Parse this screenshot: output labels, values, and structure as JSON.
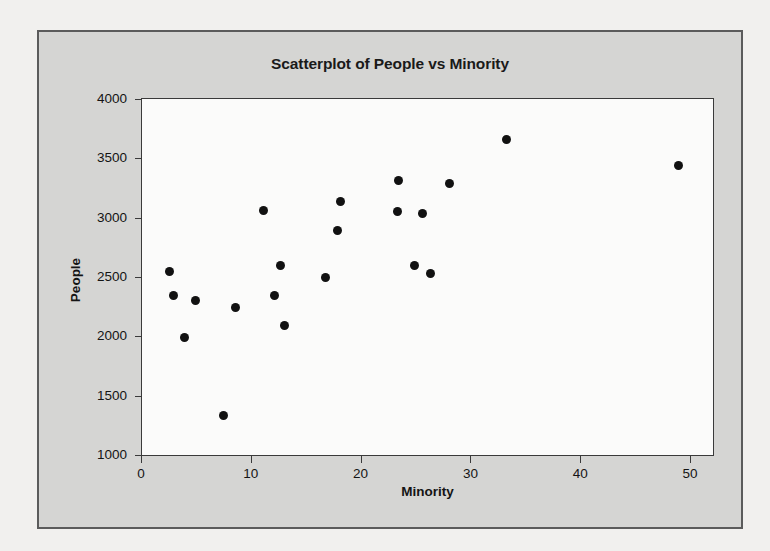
{
  "page": {
    "background_color": "#f1f0ee",
    "bleed_text": [
      "in the report of amounts and amounts",
      "of computed values for the population",
      "fit a regression equation, estimating a plot"
    ]
  },
  "card": {
    "background_color": "#d5d5d3",
    "border_color": "#5b5b5b"
  },
  "chart_data": {
    "type": "scatter",
    "title": "Scatterplot of People vs Minority",
    "xlabel": "Minority",
    "ylabel": "People",
    "xlim": [
      0,
      52
    ],
    "ylim": [
      1000,
      4000
    ],
    "xticks": [
      0,
      10,
      20,
      30,
      40,
      50
    ],
    "xtick_labels": [
      "0",
      "10",
      "20",
      "30",
      "40",
      "50"
    ],
    "yticks": [
      1000,
      1500,
      2000,
      2500,
      3000,
      3500,
      4000
    ],
    "ytick_labels": [
      "1000",
      "1500",
      "2000",
      "2500",
      "3000",
      "3500",
      "4000"
    ],
    "grid": false,
    "legend": false,
    "marker": {
      "shape": "circle",
      "color": "#111111",
      "size_px": 9
    },
    "plot_background_color": "#fbfbfa",
    "axis_color": "#3a3a3a",
    "series": [
      {
        "name": "People vs Minority",
        "points": [
          {
            "x": 2.5,
            "y": 2550
          },
          {
            "x": 2.9,
            "y": 2340
          },
          {
            "x": 3.9,
            "y": 1990
          },
          {
            "x": 4.9,
            "y": 2300
          },
          {
            "x": 7.4,
            "y": 1330
          },
          {
            "x": 8.5,
            "y": 2240
          },
          {
            "x": 11.1,
            "y": 3060
          },
          {
            "x": 12.1,
            "y": 2340
          },
          {
            "x": 12.6,
            "y": 2600
          },
          {
            "x": 13.0,
            "y": 2090
          },
          {
            "x": 16.7,
            "y": 2500
          },
          {
            "x": 17.8,
            "y": 2890
          },
          {
            "x": 18.1,
            "y": 3140
          },
          {
            "x": 23.4,
            "y": 3310
          },
          {
            "x": 23.3,
            "y": 3050
          },
          {
            "x": 24.8,
            "y": 2600
          },
          {
            "x": 25.5,
            "y": 3035
          },
          {
            "x": 26.3,
            "y": 2530
          },
          {
            "x": 28.0,
            "y": 3290
          },
          {
            "x": 33.2,
            "y": 3660
          },
          {
            "x": 48.9,
            "y": 3440
          }
        ]
      }
    ]
  }
}
